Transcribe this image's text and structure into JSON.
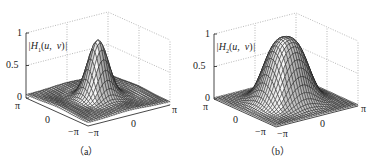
{
  "chart_data": [
    {
      "type": "surface3d",
      "panel": "(a)",
      "zlabel": "|H1(u, v)|",
      "zlabel_parts": {
        "bar_open": "|",
        "H": "H",
        "sub": "1",
        "args": "(u, v)",
        "bar_close": "|"
      },
      "z_ticks": [
        "1",
        "0.5",
        "0"
      ],
      "x_ticks": [
        "π",
        "0",
        "−π"
      ],
      "y_ticks": [
        "−π",
        "0",
        "π"
      ],
      "zlim": [
        0,
        1
      ],
      "xlim": [
        "−π",
        "π"
      ],
      "ylim": [
        "−π",
        "π"
      ],
      "grid": true,
      "description": "Sharp central peak reaching ~0.95 at origin with ripples/lobes ~0.1-0.15 toward the corners",
      "peak": 0.95,
      "edge_level": 0.12
    },
    {
      "type": "surface3d",
      "panel": "(b)",
      "zlabel": "|H2(u, v)|",
      "zlabel_parts": {
        "bar_open": "|",
        "H": "H",
        "sub": "2",
        "args": "(u, v)",
        "bar_close": "|"
      },
      "z_ticks": [
        "1",
        "0.5",
        "0"
      ],
      "x_ticks": [
        "π",
        "0",
        "−π"
      ],
      "y_ticks": [
        "−π",
        "0",
        "π"
      ],
      "zlim": [
        0,
        1
      ],
      "xlim": [
        "−π",
        "π"
      ],
      "ylim": [
        "−π",
        "π"
      ],
      "grid": true,
      "description": "Broad smooth Gaussian-like bump reaching ~0.98 at origin, flat near 0 at edges",
      "peak": 0.98,
      "edge_level": 0.02
    }
  ],
  "panels": {
    "a": {
      "caption": "（a）",
      "ztick_1": "1",
      "ztick_05": "0.5",
      "ztick_0": "0",
      "left_pi": "π",
      "left_0": "0",
      "left_negpi": "−π",
      "right_negpi": "−π",
      "right_0": "0",
      "right_pi": "π",
      "zlabel_bar1": "|",
      "zlabel_H": "H",
      "zlabel_sub": "1",
      "zlabel_args": "(u, v)",
      "zlabel_bar2": "|"
    },
    "b": {
      "caption": "（b）",
      "ztick_1": "1",
      "ztick_05": "0.5",
      "ztick_0": "0",
      "left_pi": "π",
      "left_0": "0",
      "left_negpi": "−π",
      "right_negpi": "−π",
      "right_0": "0",
      "right_pi": "π",
      "zlabel_bar1": "|",
      "zlabel_H": "H",
      "zlabel_sub": "2",
      "zlabel_args": "(u, v)",
      "zlabel_bar2": "|"
    }
  },
  "colors": {
    "mesh": "#1a1a1a",
    "mesh_light": "#f2f2f2",
    "grid": "#9a9a9a",
    "axis": "#333333",
    "text": "#222222"
  }
}
